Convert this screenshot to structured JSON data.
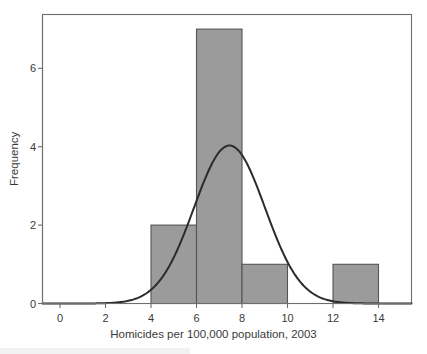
{
  "chart_data": {
    "type": "bar",
    "title": "",
    "subtitle": "",
    "xlabel": "Homicides per 100,000 population, 2003",
    "ylabel": "Frequency",
    "xlim": [
      -1.5,
      15.5
    ],
    "ylim": [
      0,
      7.4
    ],
    "xticks": [
      0,
      2,
      4,
      6,
      8,
      10,
      12,
      14
    ],
    "xtick_labels": [
      "0",
      "2",
      "4",
      "6",
      "8",
      "10",
      "12",
      "14"
    ],
    "yticks": [
      0,
      2,
      4,
      6
    ],
    "ytick_labels": [
      "0",
      "2",
      "4",
      "6"
    ],
    "grid": false,
    "legend": null,
    "bin_width": 2,
    "bins": [
      {
        "start": 4,
        "end": 6,
        "value": 2
      },
      {
        "start": 6,
        "end": 8,
        "value": 7
      },
      {
        "start": 8,
        "end": 10,
        "value": 1
      },
      {
        "start": 12,
        "end": 14,
        "value": 1
      }
    ],
    "categories": [
      "4-6",
      "6-8",
      "8-10",
      "12-14"
    ],
    "values": [
      2,
      7,
      1,
      1
    ],
    "overlay_curve": {
      "name": "normal-fit",
      "type": "line",
      "peak_x": 7.45,
      "peak_y": 4.03,
      "sigma": 1.56,
      "x_start": -1.5,
      "x_end": 15.5
    },
    "colors": {
      "bar_fill": "#9b9b9b",
      "bar_border": "#555555",
      "curve": "#2b2b2b",
      "axis": "#6e6e6e",
      "text": "#3a3a3a",
      "background": "#ffffff"
    }
  },
  "axes": {
    "x_title": "Homicides per 100,000 population, 2003",
    "y_title": "Frequency",
    "x_ticks": [
      "0",
      "2",
      "4",
      "6",
      "8",
      "10",
      "12",
      "14"
    ],
    "y_ticks": [
      "0",
      "2",
      "4",
      "6"
    ]
  }
}
